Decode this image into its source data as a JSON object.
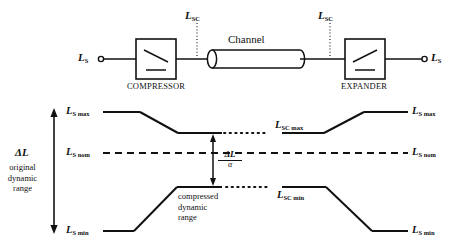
{
  "figure": {
    "type": "diagram"
  },
  "block_diagram": {
    "input_terminal_label": "L",
    "input_terminal_sub": "S",
    "output_terminal_label": "L",
    "output_terminal_sub": "S",
    "compressor_label": "COMPRESSOR",
    "expander_label": "EXPANDER",
    "channel_label": "Channel",
    "tap_left_label": "L",
    "tap_left_sub": "SC",
    "tap_right_label": "L",
    "tap_right_sub": "SC"
  },
  "level_diagram": {
    "left_labels": {
      "max": "L",
      "max_sub": "S max",
      "nom": "L",
      "nom_sub": "S nom",
      "min": "L",
      "min_sub": "S min"
    },
    "right_labels": {
      "max": "L",
      "max_sub": "S max",
      "nom": "L",
      "nom_sub": "S nom",
      "min": "L",
      "min_sub": "S min"
    },
    "channel_labels": {
      "sc_max": "L",
      "sc_max_sub": "SC max",
      "sc_min": "L",
      "sc_min_sub": "SC min"
    },
    "range_arrow": {
      "symbol": "ΔL",
      "caption_line1": "original",
      "caption_line2": "dynamic",
      "caption_line3": "range"
    },
    "compressed_arrow": {
      "numerator": "ΔL",
      "denominator": "α",
      "caption_line1": "compressed",
      "caption_line2": "dynamic",
      "caption_line3": "range"
    }
  },
  "colors": {
    "ink": "#111111",
    "background": "#ffffff",
    "faint": "#c9c9c9"
  }
}
